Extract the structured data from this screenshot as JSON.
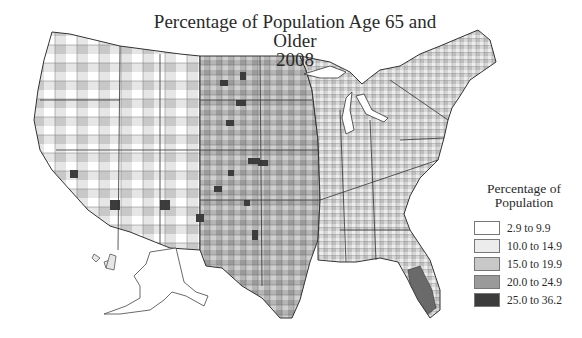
{
  "title": {
    "line1": "Percentage of Population Age 65 and Older",
    "line2": "2008"
  },
  "legend": {
    "title_line1": "Percentage of",
    "title_line2": "Population",
    "items": [
      {
        "label": "2.9 to 9.9",
        "color": "#ffffff"
      },
      {
        "label": "10.0 to 14.9",
        "color": "#ececec"
      },
      {
        "label": "15.0 to 19.9",
        "color": "#c8c8c8"
      },
      {
        "label": "20.0 to 24.9",
        "color": "#9a9a9a"
      },
      {
        "label": "25.0 to 36.2",
        "color": "#3c3c3c"
      }
    ]
  },
  "map": {
    "type": "choropleth",
    "geography": "US counties",
    "variable": "Percentage of population age 65 and older",
    "year": "2008",
    "border_color": "#444444"
  }
}
